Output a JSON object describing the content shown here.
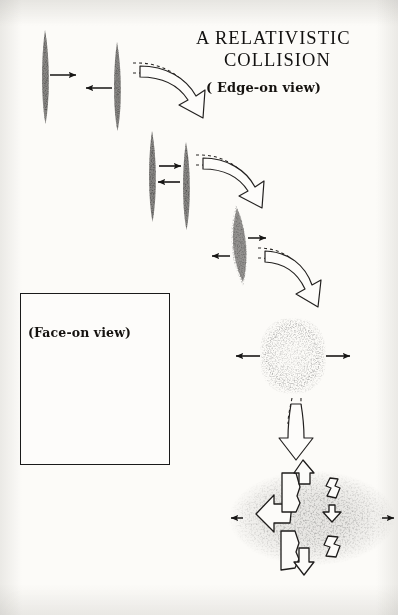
{
  "figure": {
    "title_line_1": "A RELATIVISTIC",
    "title_line_2": "COLLISION",
    "edge_on_caption": "( Edge-on view)",
    "face_on_caption": "(Face-on view)",
    "medium": "ink stipple drawing",
    "background_color": "#fcfbf8",
    "ink_color": "#141312"
  },
  "inset": {
    "caption": "(Face-on view)",
    "border_color": "#1a1a1a",
    "blob_shape": "circular stippled disk"
  },
  "stages": [
    {
      "id": "stage-1",
      "label": "approaching pancakes",
      "description": "two thin Lorentz-contracted nuclei approaching",
      "arrows": [
        "right",
        "left"
      ]
    },
    {
      "id": "stage-2",
      "label": "contact",
      "description": "pancakes touching, arrows inward",
      "arrows": [
        "right",
        "left"
      ]
    },
    {
      "id": "stage-3",
      "label": "compressed overlap",
      "description": "merged dense lens, arrows outward",
      "arrows": [
        "right",
        "left"
      ]
    },
    {
      "id": "stage-4",
      "label": "expanding fireball",
      "description": "rounded barrel blob expanding, arrows outward",
      "arrows": [
        "right",
        "left"
      ]
    },
    {
      "id": "stage-5",
      "label": "fragmentation",
      "description": "diffuse cloud with outgoing fragment arrows",
      "arrows": [
        "right",
        "left"
      ]
    }
  ],
  "flow_arrows": [
    {
      "id": "flow-arrow-1",
      "style": "curved hollow",
      "from": "stage-1",
      "to": "stage-2"
    },
    {
      "id": "flow-arrow-2",
      "style": "curved hollow",
      "from": "stage-2",
      "to": "stage-3"
    },
    {
      "id": "flow-arrow-3",
      "style": "curved hollow",
      "from": "stage-3",
      "to": "stage-4"
    },
    {
      "id": "flow-arrow-4",
      "style": "straight hollow",
      "from": "stage-4",
      "to": "stage-5"
    }
  ]
}
